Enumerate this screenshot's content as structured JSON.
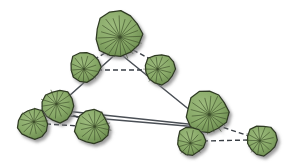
{
  "figure": {
    "background_color": "#ffffff",
    "width": 287,
    "height": 168
  },
  "style": {
    "canopy_fill": "#8bab6b",
    "canopy_fill_dark": "#6f8f53",
    "canopy_stroke": "#2f3b22",
    "canopy_vein": "#3d4f2b",
    "shadow_color": "#9a9a9a",
    "solid_edge_color": "#4a4f55",
    "dashed_edge_color": "#3a3f45",
    "solid_edge_width": 1.5,
    "dashed_edge_width": 1.4,
    "dash_pattern": "5,3"
  },
  "chart_data": {
    "type": "scatter",
    "xlabel": "",
    "ylabel": "",
    "xlim": [
      0,
      287
    ],
    "ylim": [
      0,
      168
    ],
    "grid": false,
    "legend": "none",
    "nodes": [
      {
        "id": "t1",
        "label": "crown-top-large",
        "x": 118,
        "y": 34,
        "r": 23,
        "size": "large"
      },
      {
        "id": "t2",
        "label": "crown-upper-left",
        "x": 85,
        "y": 67,
        "r": 15,
        "size": "small"
      },
      {
        "id": "t3",
        "label": "crown-upper-right",
        "x": 160,
        "y": 69,
        "r": 15,
        "size": "small"
      },
      {
        "id": "t4",
        "label": "crown-mid-left",
        "x": 58,
        "y": 106,
        "r": 16,
        "size": "medium"
      },
      {
        "id": "t5",
        "label": "crown-far-left",
        "x": 33,
        "y": 124,
        "r": 15,
        "size": "small"
      },
      {
        "id": "t6",
        "label": "crown-bottom-center",
        "x": 92,
        "y": 127,
        "r": 17,
        "size": "medium"
      },
      {
        "id": "t7",
        "label": "crown-right-large",
        "x": 207,
        "y": 112,
        "r": 21,
        "size": "large"
      },
      {
        "id": "t8",
        "label": "crown-bottom-right",
        "x": 191,
        "y": 141,
        "r": 14,
        "size": "small"
      },
      {
        "id": "t9",
        "label": "crown-far-right",
        "x": 262,
        "y": 140,
        "r": 15,
        "size": "small"
      }
    ],
    "solid_edges": [
      {
        "from": "apex",
        "to": "t4",
        "x1": 118,
        "y1": 52,
        "x2": 58,
        "y2": 106
      },
      {
        "from": "apex",
        "to": "t7",
        "x1": 118,
        "y1": 52,
        "x2": 207,
        "y2": 124
      },
      {
        "from": "t4",
        "to": "t7",
        "x1": 56,
        "y1": 110,
        "x2": 207,
        "y2": 126
      },
      {
        "from": "t4b",
        "to": "t7b",
        "x1": 58,
        "y1": 115,
        "x2": 210,
        "y2": 128
      }
    ],
    "dashed_edges": [
      {
        "from": "t1",
        "to": "t2",
        "x1": 105,
        "y1": 53,
        "x2": 90,
        "y2": 62
      },
      {
        "from": "t1",
        "to": "t3",
        "x1": 133,
        "y1": 50,
        "x2": 156,
        "y2": 62
      },
      {
        "from": "t2",
        "to": "t3",
        "x1": 97,
        "y1": 70,
        "x2": 148,
        "y2": 70
      },
      {
        "from": "t4",
        "to": "t6",
        "x1": 66,
        "y1": 112,
        "x2": 86,
        "y2": 121
      },
      {
        "from": "t5",
        "to": "t6",
        "x1": 46,
        "y1": 124,
        "x2": 80,
        "y2": 126
      },
      {
        "from": "t7",
        "to": "t9",
        "x1": 216,
        "y1": 125,
        "x2": 252,
        "y2": 137
      },
      {
        "from": "t8",
        "to": "t9",
        "x1": 203,
        "y1": 141,
        "x2": 249,
        "y2": 140
      }
    ]
  }
}
